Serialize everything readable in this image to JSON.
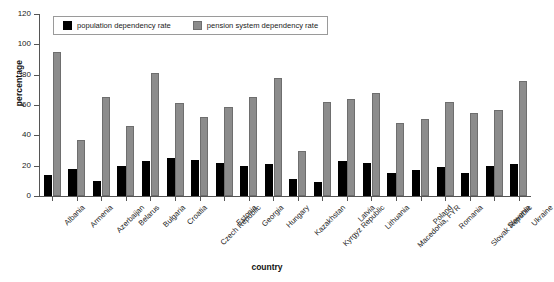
{
  "chart_data": {
    "type": "bar",
    "title": "",
    "subtitle": "",
    "xlabel": "country",
    "ylabel": "percentage",
    "ylim": [
      0,
      120
    ],
    "yticks": [
      0,
      20,
      40,
      60,
      80,
      100,
      120
    ],
    "grid": false,
    "legend_position": "top-left-inside",
    "categories": [
      "Albania",
      "Armenia",
      "Azerbaijan",
      "Belarus",
      "Bulgaria",
      "Croatia",
      "Czech Republic",
      "Estonia",
      "Georgia",
      "Hungary",
      "Kazakhstan",
      "Kyrgyz Republic",
      "Latvia",
      "Lithuania",
      "Macedonia, FYR",
      "Poland",
      "Romania",
      "Slovak Republic",
      "Slovenia",
      "Ukraine"
    ],
    "series": [
      {
        "name": "population dependency rate",
        "color": "#000000",
        "values": [
          14,
          18,
          10,
          20,
          23,
          25,
          24,
          22,
          20,
          21,
          11,
          9,
          23,
          22,
          15,
          17,
          19,
          15,
          20,
          21
        ]
      },
      {
        "name": "pension system dependency rate",
        "color": "#8c8c8c",
        "values": [
          95,
          37,
          65,
          46,
          81,
          61,
          52,
          59,
          65,
          78,
          30,
          62,
          64,
          68,
          48,
          51,
          62,
          55,
          57,
          76
        ]
      }
    ]
  },
  "legend": {
    "entries": [
      {
        "label": "population dependency rate",
        "key": "pop"
      },
      {
        "label": "pension system dependency rate",
        "key": "pen"
      }
    ]
  }
}
